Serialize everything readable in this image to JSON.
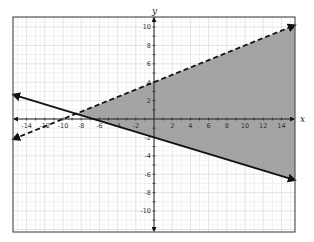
{
  "chart_data": {
    "type": "line",
    "title": "",
    "xlabel": "x",
    "ylabel": "y",
    "xlim": [
      -15.5,
      15.5
    ],
    "ylim": [
      -12.3,
      11.1
    ],
    "grid": true,
    "x_ticks": [
      -14,
      -12,
      -10,
      -8,
      -6,
      -4,
      -2,
      2,
      4,
      6,
      8,
      10,
      12,
      14
    ],
    "y_ticks": [
      -10,
      -8,
      -6,
      -4,
      -2,
      2,
      4,
      6,
      8,
      10
    ],
    "series": [
      {
        "name": "boundary-dashed",
        "style": "dashed",
        "equation": "y = 0.4x + 4",
        "slope": 0.4,
        "intercept": 4,
        "x": [
          -15.5,
          15.5
        ],
        "y": [
          -2.2,
          10.2
        ],
        "arrows": "both"
      },
      {
        "name": "boundary-solid",
        "style": "solid",
        "equation": "y = -0.3x - 2",
        "slope": -0.3,
        "intercept": -2,
        "x": [
          -15.5,
          15.5
        ],
        "y": [
          2.65,
          -6.65
        ],
        "arrows": "both"
      }
    ],
    "shaded_region": {
      "description": "y >= -0.3x - 2 and y < 0.4x + 4",
      "vertices": [
        [
          -8.57,
          0.57
        ],
        [
          15.5,
          10.2
        ],
        [
          15.5,
          -6.65
        ]
      ],
      "color": "#9a9a9a"
    },
    "intersection": [
      -8.57,
      0.57
    ]
  },
  "colors": {
    "shade": "#9a9a9a",
    "line": "#111111",
    "grid": "#e4e4e4",
    "grid_major": "#d2d2d2",
    "frame": "#555555"
  }
}
